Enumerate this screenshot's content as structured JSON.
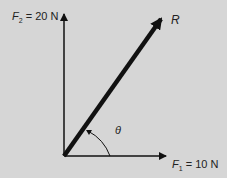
{
  "diagram": {
    "type": "vector-addition",
    "background": "#d6d6d6",
    "vectors": [
      {
        "name": "F2",
        "label_symbol": "F",
        "label_sub": "2",
        "label_value": "= 20 N",
        "direction": "up"
      },
      {
        "name": "F1",
        "label_symbol": "F",
        "label_sub": "1",
        "label_value": "= 10 N",
        "direction": "right"
      },
      {
        "name": "R",
        "label_symbol": "R",
        "direction": "resultant"
      }
    ],
    "angle_label": "θ"
  }
}
